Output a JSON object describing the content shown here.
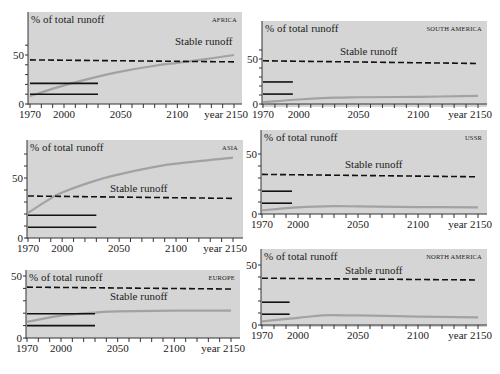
{
  "figure": {
    "ylabel": "% of total runoff",
    "stable_label": "Stable runoff",
    "x_ticks": [
      "1970",
      "2000",
      "2050",
      "2100",
      "year 2150"
    ],
    "colors": {
      "panel_bg": "#d5d5d5",
      "curve": "#a2a2a2",
      "lines": "#111111",
      "text": "#222222"
    }
  },
  "chart_data": [
    {
      "type": "line",
      "title": "AFRICA",
      "xlabel": "year",
      "ylabel": "% of total runoff",
      "x_ticks": [
        1970,
        2000,
        2050,
        2100,
        2150
      ],
      "y_ticks": [
        0,
        50
      ],
      "xlim": [
        1970,
        2150
      ],
      "series": [
        {
          "name": "Water use (curve)",
          "x": [
            1970,
            2000,
            2030,
            2050,
            2080,
            2100,
            2120,
            2150
          ],
          "values": [
            8,
            19,
            28,
            33,
            39,
            42,
            45,
            50
          ]
        },
        {
          "name": "Stable runoff",
          "style": "dashed",
          "x": [
            1970,
            2150
          ],
          "values": [
            45,
            43
          ]
        },
        {
          "name": "Reference line 1",
          "style": "solid",
          "x": [
            1970,
            2030
          ],
          "values": [
            21,
            21
          ]
        },
        {
          "name": "Reference line 2",
          "style": "solid",
          "x": [
            1970,
            2030
          ],
          "values": [
            10,
            10
          ]
        }
      ],
      "annotations": [
        "Stable runoff"
      ]
    },
    {
      "type": "line",
      "title": "SOUTH AMERICA",
      "xlabel": "year",
      "ylabel": "% of total runoff",
      "x_ticks": [
        1970,
        2000,
        2050,
        2100,
        2150
      ],
      "y_ticks": [
        0,
        50
      ],
      "xlim": [
        1970,
        2150
      ],
      "series": [
        {
          "name": "Water use (curve)",
          "x": [
            1970,
            2000,
            2030,
            2050,
            2100,
            2150
          ],
          "values": [
            2,
            5,
            7,
            7.5,
            8,
            9
          ]
        },
        {
          "name": "Stable runoff",
          "style": "dashed",
          "x": [
            1970,
            2150
          ],
          "values": [
            48,
            45
          ]
        },
        {
          "name": "Reference line 1",
          "style": "solid",
          "x": [
            1970,
            1995
          ],
          "values": [
            24.5,
            24.5
          ]
        },
        {
          "name": "Reference line 2",
          "style": "solid",
          "x": [
            1970,
            1995
          ],
          "values": [
            11,
            11
          ]
        }
      ],
      "annotations": [
        "Stable runoff"
      ]
    },
    {
      "type": "line",
      "title": "ASIA",
      "xlabel": "year",
      "ylabel": "% of total runoff",
      "x_ticks": [
        1970,
        2000,
        2050,
        2100,
        2150
      ],
      "y_ticks": [
        0,
        50
      ],
      "xlim": [
        1970,
        2150
      ],
      "series": [
        {
          "name": "Water use (curve)",
          "x": [
            1970,
            1990,
            2000,
            2030,
            2050,
            2080,
            2100,
            2150
          ],
          "values": [
            21,
            33,
            38,
            48,
            53,
            59,
            62,
            67
          ]
        },
        {
          "name": "Stable runoff",
          "style": "dashed",
          "x": [
            1970,
            2150
          ],
          "values": [
            35,
            33
          ]
        },
        {
          "name": "Reference line 1",
          "style": "solid",
          "x": [
            1970,
            2030
          ],
          "values": [
            19,
            19
          ]
        },
        {
          "name": "Reference line 2",
          "style": "solid",
          "x": [
            1970,
            2030
          ],
          "values": [
            9,
            9
          ]
        }
      ],
      "annotations": [
        "Stable runoff"
      ]
    },
    {
      "type": "line",
      "title": "USSR",
      "xlabel": "year",
      "ylabel": "% of total runoff",
      "x_ticks": [
        1970,
        2000,
        2050,
        2100,
        2150
      ],
      "y_ticks": [
        0,
        50
      ],
      "xlim": [
        1970,
        2150
      ],
      "series": [
        {
          "name": "Water use (curve)",
          "x": [
            1970,
            2000,
            2030,
            2050,
            2100,
            2150
          ],
          "values": [
            3,
            5.5,
            6.5,
            6.3,
            5.8,
            5.5
          ]
        },
        {
          "name": "Stable runoff",
          "style": "dashed",
          "x": [
            1970,
            2150
          ],
          "values": [
            33,
            31
          ]
        },
        {
          "name": "Reference line 1",
          "style": "solid",
          "x": [
            1970,
            1995
          ],
          "values": [
            19,
            19
          ]
        },
        {
          "name": "Reference line 2",
          "style": "solid",
          "x": [
            1970,
            1995
          ],
          "values": [
            9,
            9
          ]
        }
      ],
      "annotations": [
        "Stable runoff"
      ]
    },
    {
      "type": "line",
      "title": "EUROPE",
      "xlabel": "year",
      "ylabel": "% of total runoff",
      "x_ticks": [
        1970,
        2000,
        2050,
        2100,
        2150
      ],
      "y_ticks": [
        0,
        50
      ],
      "xlim": [
        1970,
        2150
      ],
      "series": [
        {
          "name": "Water use (curve)",
          "x": [
            1970,
            2000,
            2030,
            2050,
            2100,
            2150
          ],
          "values": [
            13,
            18,
            20.5,
            21.5,
            22,
            22
          ]
        },
        {
          "name": "Stable runoff",
          "style": "dashed",
          "x": [
            1970,
            2150
          ],
          "values": [
            41,
            39.5
          ]
        },
        {
          "name": "Reference line 1",
          "style": "solid",
          "x": [
            1970,
            2030
          ],
          "values": [
            19.5,
            19.5
          ]
        },
        {
          "name": "Reference line 2",
          "style": "solid",
          "x": [
            1970,
            2030
          ],
          "values": [
            10,
            10
          ]
        }
      ],
      "annotations": [
        "Stable runoff"
      ]
    },
    {
      "type": "line",
      "title": "NORTH AMERICA",
      "xlabel": "year",
      "ylabel": "% of total runoff",
      "x_ticks": [
        1970,
        2000,
        2050,
        2100,
        2150
      ],
      "y_ticks": [
        0,
        50
      ],
      "xlim": [
        1970,
        2150
      ],
      "series": [
        {
          "name": "Water use (curve)",
          "x": [
            1970,
            2000,
            2020,
            2030,
            2050,
            2100,
            2150
          ],
          "values": [
            3,
            6,
            8,
            8.3,
            8,
            7,
            6.3
          ]
        },
        {
          "name": "Stable runoff",
          "style": "dashed",
          "x": [
            1970,
            2150
          ],
          "values": [
            39,
            37.5
          ]
        },
        {
          "name": "Reference line 1",
          "style": "solid",
          "x": [
            1970,
            1993
          ],
          "values": [
            19,
            19
          ]
        },
        {
          "name": "Reference line 2",
          "style": "solid",
          "x": [
            1970,
            1993
          ],
          "values": [
            9,
            9
          ]
        }
      ],
      "annotations": [
        "Stable runoff"
      ]
    }
  ],
  "layout": [
    {
      "id": "africa",
      "bg": [
        28,
        12,
        242,
        104
      ],
      "axis_x": 28,
      "x0": 30,
      "x1": 234,
      "y0": 104,
      "y50": 55,
      "label_pos": [
        175,
        45
      ],
      "ymax_tick": 60
    },
    {
      "id": "south-america",
      "bg": [
        262,
        21,
        487,
        107
      ],
      "axis_x": 262,
      "x0": 263,
      "x1": 478,
      "y0": 104,
      "y50": 59,
      "label_pos": [
        340,
        55
      ],
      "ymax_tick": 60
    },
    {
      "id": "asia",
      "bg": [
        27,
        140,
        243,
        238
      ],
      "axis_x": 27,
      "x0": 28,
      "x1": 233,
      "y0": 238,
      "y50": 178,
      "label_pos": [
        110,
        192
      ],
      "ymax_tick": 70
    },
    {
      "id": "ussr",
      "bg": [
        261,
        130,
        487,
        214
      ],
      "axis_x": 261,
      "x0": 262,
      "x1": 478,
      "y0": 214,
      "y50": 154,
      "label_pos": [
        345,
        168
      ],
      "ymax_tick": 55
    },
    {
      "id": "europe",
      "bg": [
        26,
        270,
        240,
        338
      ],
      "axis_x": 26,
      "x0": 27,
      "x1": 231,
      "y0": 338,
      "y50": 276,
      "label_pos": [
        110,
        300
      ],
      "ymax_tick": 50
    },
    {
      "id": "north-america",
      "bg": [
        261,
        249,
        487,
        327
      ],
      "axis_x": 261,
      "x0": 262,
      "x1": 478,
      "y0": 325,
      "y50": 265,
      "label_pos": [
        345,
        274
      ],
      "ymax_tick": 55
    }
  ]
}
